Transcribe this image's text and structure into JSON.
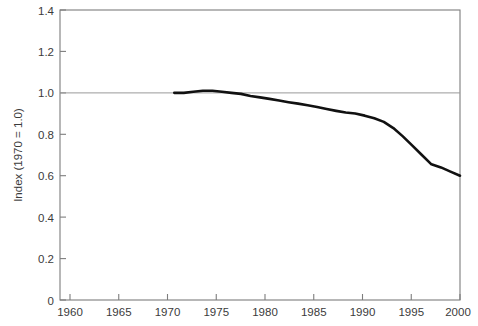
{
  "chart_data": {
    "type": "line",
    "title": "",
    "subtitle": "",
    "xlabel": "",
    "ylabel": "Index (1970 = 1.0)",
    "xlim": [
      1958,
      2000
    ],
    "ylim": [
      0,
      1.4
    ],
    "grid": false,
    "legend": null,
    "x_tick_labels": [
      "1960",
      "1965",
      "1970",
      "1975",
      "1980",
      "1985",
      "1990",
      "1995",
      "2000"
    ],
    "x_ticks": [
      1960,
      1965,
      1970,
      1975,
      1980,
      1985,
      1990,
      1995,
      2000
    ],
    "y_tick_labels": [
      "0",
      "0.2",
      "0.4",
      "0.6",
      "0.8",
      "1.0",
      "1.2",
      "1.4"
    ],
    "y_ticks": [
      0,
      0.2,
      0.4,
      0.6,
      0.8,
      1.0,
      1.2,
      1.4
    ],
    "annotations": [
      {
        "name": "reference-line",
        "kind": "hline",
        "value": 1.0,
        "label": "",
        "color": "#9a9a9a"
      }
    ],
    "series": [
      {
        "name": "index",
        "color": "#111111",
        "x": [
          1970,
          1971,
          1972,
          1973,
          1974,
          1975,
          1976,
          1977,
          1978,
          1979,
          1980,
          1981,
          1982,
          1983,
          1984,
          1985,
          1986,
          1987,
          1988,
          1989,
          1990,
          1991,
          1992,
          1993,
          1994,
          1995,
          1996,
          1997,
          1998,
          1999,
          2000
        ],
        "values": [
          1.0,
          1.0,
          1.005,
          1.01,
          1.01,
          1.005,
          1.0,
          0.995,
          0.985,
          0.978,
          0.971,
          0.963,
          0.955,
          0.948,
          0.94,
          0.932,
          0.922,
          0.913,
          0.905,
          0.9,
          0.89,
          0.877,
          0.86,
          0.83,
          0.79,
          0.745,
          0.7,
          0.655,
          0.64,
          0.62,
          0.6
        ]
      }
    ]
  },
  "colors": {
    "series": "#111111",
    "frame": "#7d7d7d",
    "reference": "#9a9a9a",
    "text": "#3b3b3b",
    "background": "#ffffff"
  }
}
